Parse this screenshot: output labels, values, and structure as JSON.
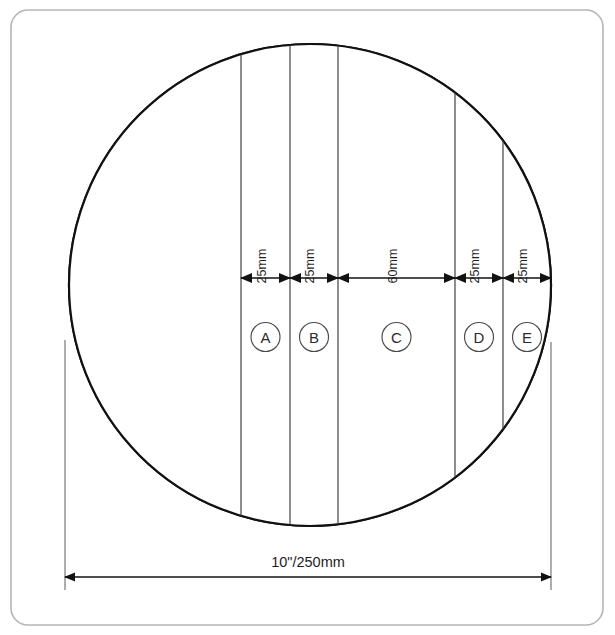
{
  "diagram": {
    "frame": {
      "x": 11,
      "y": 10,
      "width": 592,
      "height": 615,
      "radius": 17,
      "stroke_color": "#b5b5b5"
    },
    "disc": {
      "center_x": 310,
      "center_y": 285,
      "radius": 241,
      "outline_color": "#111111",
      "fill_color": "#ffffff",
      "shaded_fill_color": "#e9e9e9",
      "shaded_region_end_x": 241
    },
    "divider_x_positions": [
      241,
      290,
      338,
      455,
      503
    ],
    "dimension_row_y": 278,
    "letter_row_y": 337,
    "zones": [
      {
        "id": "A",
        "label": "A",
        "dimension": "25mm",
        "x_start": 241,
        "x_end": 290,
        "center_x": 265.5
      },
      {
        "id": "B",
        "label": "B",
        "dimension": "25mm",
        "x_start": 290,
        "x_end": 338,
        "center_x": 314.0
      },
      {
        "id": "C",
        "label": "C",
        "dimension": "60mm",
        "x_start": 338,
        "x_end": 455,
        "center_x": 396.5
      },
      {
        "id": "D",
        "label": "D",
        "dimension": "25mm",
        "x_start": 455,
        "x_end": 503,
        "center_x": 479.0
      },
      {
        "id": "E",
        "label": "E",
        "dimension": "25mm",
        "x_start": 503,
        "x_end": 551,
        "center_x": 527.0
      }
    ],
    "overall_dimension": {
      "label": "10\"/250mm",
      "x_start": 65,
      "x_end": 551,
      "line_y": 577,
      "label_x": 308,
      "label_y": 567,
      "witness_left_top_y": 340,
      "witness_right_top_y": 342,
      "witness_bottom_y": 590
    },
    "colors": {
      "ink": "#121212",
      "shade": "#e9e9e9",
      "frame": "#b5b5b5",
      "divider": "#3a3a3a"
    }
  }
}
